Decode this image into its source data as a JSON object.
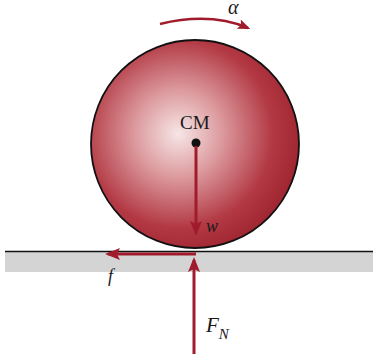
{
  "diagram": {
    "labels": {
      "angular_acceleration": "α",
      "center_of_mass": "CM",
      "weight": "w",
      "friction": "f",
      "normal_force_main": "F",
      "normal_force_sub": "N"
    },
    "colors": {
      "sphere_dark": "#a3222e",
      "sphere_light": "#f5e4e4",
      "arrow": "#a01c2c",
      "ground": "#d4d4d4",
      "outline": "#111111"
    },
    "forces": [
      {
        "name": "weight",
        "direction": "down",
        "origin": "center of mass"
      },
      {
        "name": "friction",
        "direction": "left",
        "origin": "contact point"
      },
      {
        "name": "normal force",
        "direction": "up",
        "origin": "contact point"
      }
    ],
    "rotation": "clockwise"
  }
}
